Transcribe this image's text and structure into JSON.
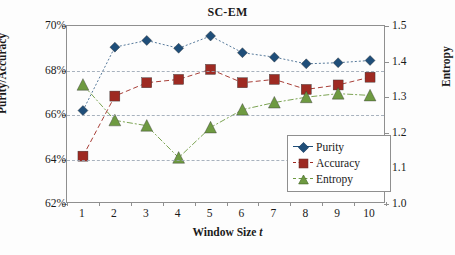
{
  "chart_data": {
    "type": "line",
    "title": "SC-EM",
    "xlabel": "Window Size t",
    "ylabel": "Purity/Accuracy",
    "y2label": "Entropy",
    "x": [
      1,
      2,
      3,
      4,
      5,
      6,
      7,
      8,
      9,
      10
    ],
    "xticklabels": [
      "1",
      "2",
      "3",
      "4",
      "5",
      "6",
      "7",
      "8",
      "9",
      "10"
    ],
    "ylim": [
      62,
      70
    ],
    "yticklabels": [
      "62%",
      "64%",
      "66%",
      "68%",
      "70%"
    ],
    "ytickvalues": [
      62,
      64,
      66,
      68,
      70
    ],
    "y2lim": [
      1.0,
      1.5
    ],
    "y2ticklabels": [
      "1.0",
      "1.1",
      "1.2",
      "1.3",
      "1.4",
      "1.5"
    ],
    "y2tickvalues": [
      1.0,
      1.1,
      1.2,
      1.3,
      1.4,
      1.5
    ],
    "grid": true,
    "legend_position": "lower-right",
    "series": [
      {
        "name": "Purity",
        "axis": "left",
        "marker": "diamond",
        "color": "#1F4E79",
        "values": [
          66.2,
          69.05,
          69.35,
          69.0,
          69.55,
          68.8,
          68.6,
          68.3,
          68.35,
          68.45
        ]
      },
      {
        "name": "Accuracy",
        "axis": "left",
        "marker": "square",
        "color": "#9E2A22",
        "values": [
          64.15,
          66.85,
          67.45,
          67.6,
          68.05,
          67.45,
          67.6,
          67.15,
          67.35,
          67.7
        ]
      },
      {
        "name": "Entropy",
        "axis": "right",
        "marker": "triangle",
        "color": "#6E9A41",
        "values": [
          1.335,
          1.235,
          1.22,
          1.13,
          1.215,
          1.265,
          1.285,
          1.3,
          1.31,
          1.305
        ]
      }
    ]
  },
  "legend": {
    "items": [
      {
        "label": "Purity"
      },
      {
        "label": "Accuracy"
      },
      {
        "label": "Entropy"
      }
    ]
  }
}
